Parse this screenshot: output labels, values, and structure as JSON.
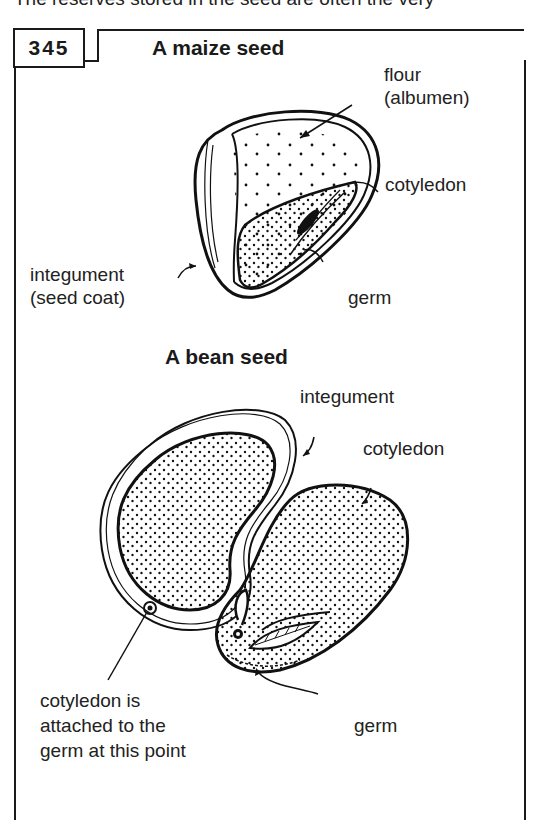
{
  "header": {
    "intro_text": "The reserves stored in the seed are often the very",
    "figure_number": "345"
  },
  "maize": {
    "title": "A maize seed",
    "labels": {
      "flour_line1": "flour",
      "flour_line2": "(albumen)",
      "cotyledon": "cotyledon",
      "integument_line1": "integument",
      "integument_line2": "(seed coat)",
      "germ": "germ"
    }
  },
  "bean": {
    "title": "A bean seed",
    "labels": {
      "integument": "integument",
      "cotyledon": "cotyledon",
      "attach_line1": "cotyledon is",
      "attach_line2": "attached to the",
      "attach_line3": "germ at this point",
      "germ": "germ"
    }
  }
}
